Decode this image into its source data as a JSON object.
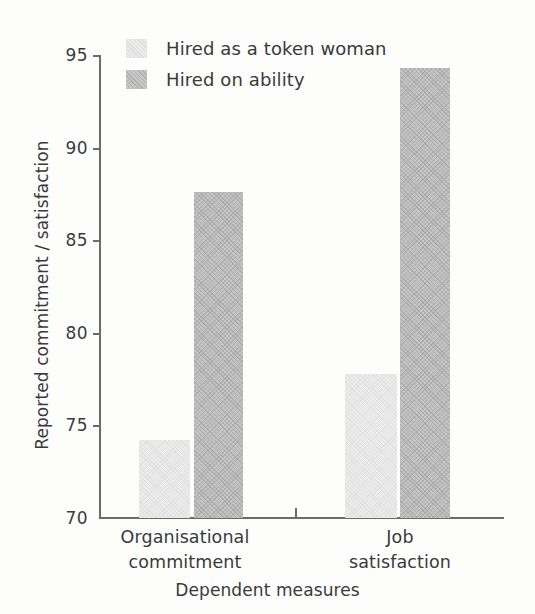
{
  "chart_data": {
    "type": "bar",
    "title": "",
    "subtitle": "",
    "xlabel": "Dependent measures",
    "ylabel": "Reported commitment / satisfaction",
    "categories": [
      "Organisational commitment",
      "Job satisfaction"
    ],
    "category_lines": [
      [
        "Organisational",
        "commitment"
      ],
      [
        "Job",
        "satisfaction"
      ]
    ],
    "series": [
      {
        "name": "Hired as a token woman",
        "color": "#ececec",
        "values": [
          74.2,
          77.8
        ]
      },
      {
        "name": "Hired on ability",
        "color": "#c6c6c6",
        "values": [
          87.6,
          94.3
        ]
      }
    ],
    "ylim": [
      70,
      95
    ],
    "yticks": [
      70,
      75,
      80,
      85,
      90,
      95
    ],
    "ytick_labels": [
      "70",
      "75",
      "80",
      "85",
      "90",
      "95"
    ],
    "grid": false,
    "legend_position": "top-left",
    "axis_color": "#6b6b6b",
    "text_color": "#3a3a3a",
    "background": "#fdfdfc"
  }
}
